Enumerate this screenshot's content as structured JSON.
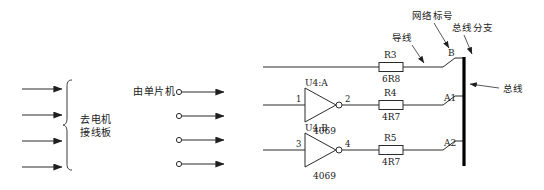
{
  "diagram": {
    "left_group": {
      "label_line1": "去电机",
      "label_line2": "接线板",
      "arrow_count": 4,
      "brace_name": "curly-brace"
    },
    "middle_group": {
      "label": "由单片机",
      "terminal_count": 4
    },
    "annotations": {
      "wire": "导线",
      "net_label": "网络标号",
      "bus_branch": "总线分支",
      "bus": "总线"
    },
    "rows": [
      {
        "id": "row-top",
        "has_gate": false,
        "resistor_ref": "R3",
        "resistor_value": "6R8",
        "net_label": "B"
      },
      {
        "id": "row-middle",
        "has_gate": true,
        "gate_ref": "U4:A",
        "gate_type": "4069",
        "pin_in": "1",
        "pin_out": "2",
        "resistor_ref": "R4",
        "resistor_value": "4R7",
        "net_label": "A1"
      },
      {
        "id": "row-bottom",
        "has_gate": true,
        "gate_ref": "U4:B",
        "gate_type": "4069",
        "pin_in": "3",
        "pin_out": "4",
        "resistor_ref": "R5",
        "resistor_value": "4R7",
        "net_label": "A2"
      }
    ],
    "colors": {
      "ink": "#1a1a1a",
      "wire": "#2b2b2b",
      "bus": "#000000",
      "background": "#ffffff"
    }
  }
}
